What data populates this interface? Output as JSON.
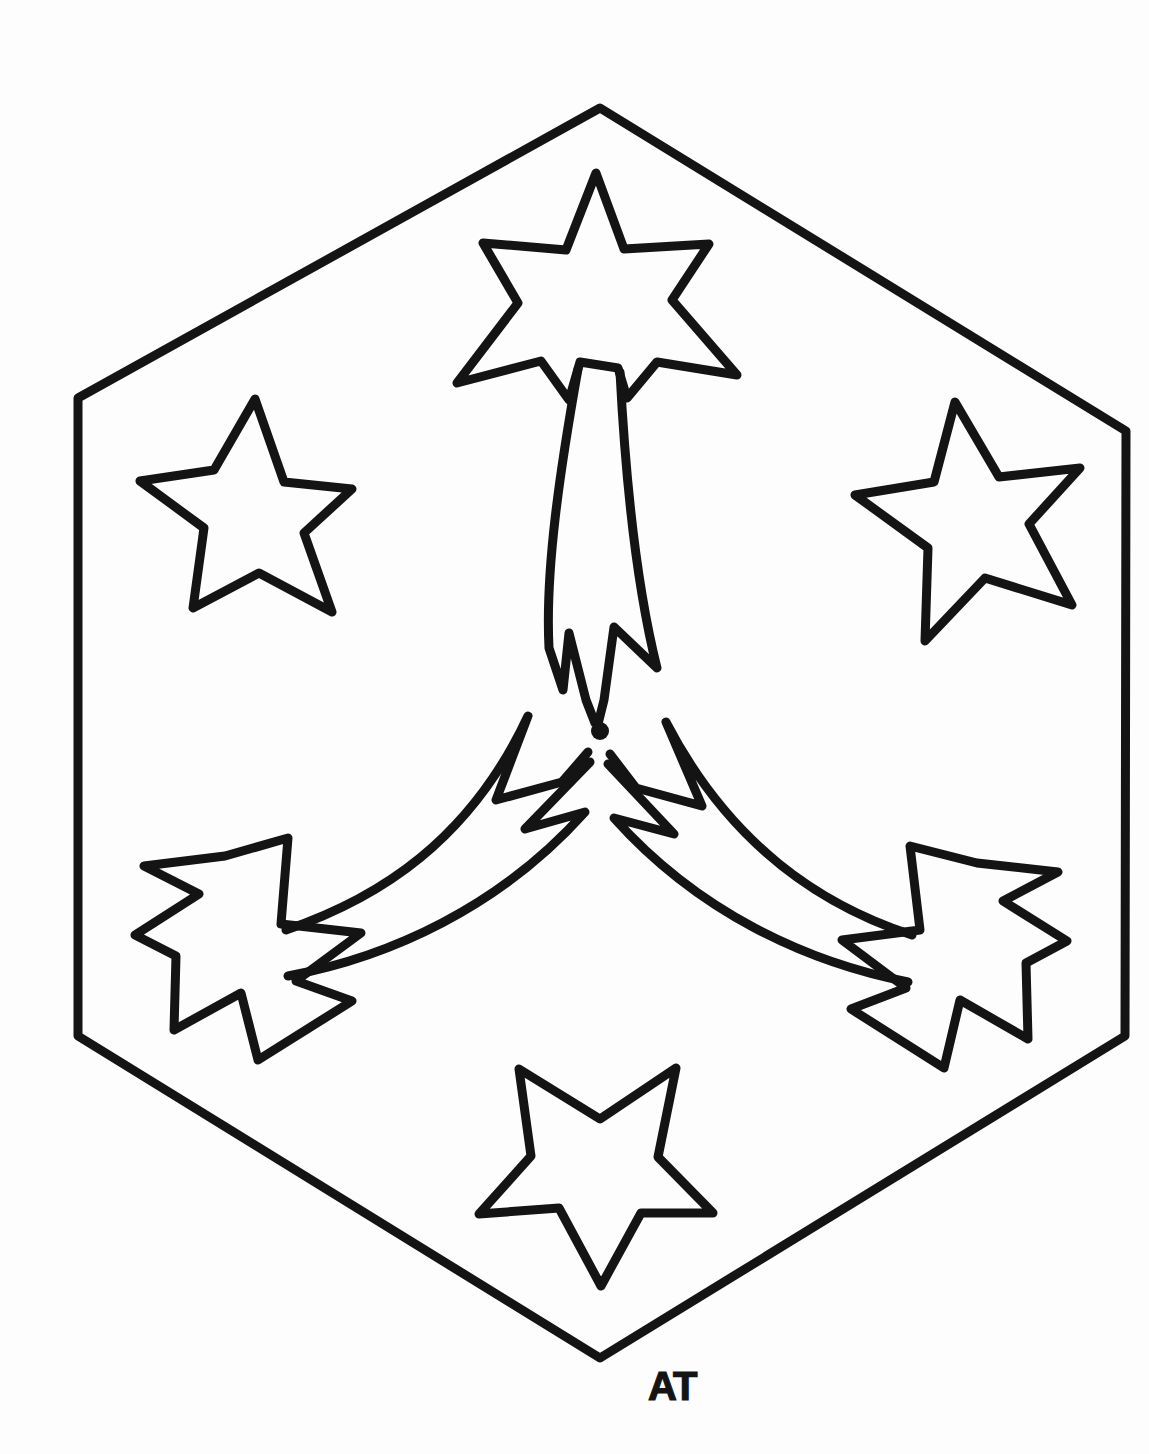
{
  "artwork": {
    "title": "Shooting Stars Hexagon",
    "medium": "hand-drawn black ink line art on white paper",
    "style": "coloring-page outline",
    "background_color": "#fdfdfd",
    "ink_color": "#141414",
    "canvas": {
      "width": 1149,
      "height": 1454
    },
    "signature": {
      "text": "AT",
      "x": 648,
      "y": 1394,
      "description": "hand-lettered initials below bottom hexagon vertex"
    },
    "frame": {
      "name": "hexagon-border",
      "sides": 6,
      "orientation": "pointy-top",
      "stroke_width": 9,
      "vertices": [
        [
          600,
          108
        ],
        [
          1125,
          430
        ],
        [
          1125,
          1035
        ],
        [
          600,
          1358
        ],
        [
          78,
          1035
        ],
        [
          78,
          398
        ]
      ]
    },
    "center_dot": {
      "name": "center-dot",
      "x": 600,
      "y": 731,
      "radius": 8
    },
    "shooting_stars": [
      {
        "id": "shooting-star-top",
        "label": "Top shooting star",
        "star_center": [
          596,
          282
        ],
        "star_outer_radius": 112,
        "star_inner_radius": 46,
        "rotation_deg": 0,
        "trail_direction": "down toward center",
        "trail_length": 420
      },
      {
        "id": "shooting-star-lower-left",
        "label": "Lower-left shooting star",
        "star_center": [
          232,
          945
        ],
        "star_outer_radius": 112,
        "star_inner_radius": 46,
        "rotation_deg": 118,
        "trail_direction": "up-right toward center",
        "trail_length": 400
      },
      {
        "id": "shooting-star-lower-right",
        "label": "Lower-right shooting star",
        "star_center": [
          968,
          960
        ],
        "star_outer_radius": 110,
        "star_inner_radius": 46,
        "rotation_deg": 242,
        "trail_direction": "up-left toward center",
        "trail_length": 400
      }
    ],
    "plain_stars": [
      {
        "id": "plain-star-upper-left",
        "label": "Upper-left star",
        "center": [
          240,
          510
        ],
        "outer_radius": 113,
        "inner_radius": 46,
        "rotation_deg": -12
      },
      {
        "id": "plain-star-upper-right",
        "label": "Upper-right star",
        "center": [
          962,
          525
        ],
        "outer_radius": 113,
        "inner_radius": 46,
        "rotation_deg": 8
      },
      {
        "id": "plain-star-bottom",
        "label": "Bottom star",
        "center": [
          600,
          1178
        ],
        "outer_radius": 113,
        "inner_radius": 46,
        "rotation_deg": 180
      }
    ],
    "counts": {
      "total_stars": 6,
      "shooting_stars": 3,
      "plain_stars": 3,
      "trails": 3
    }
  }
}
